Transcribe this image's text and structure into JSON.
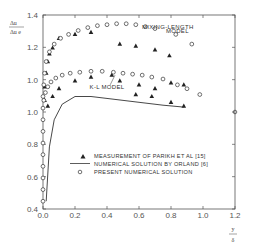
{
  "chart_data": {
    "type": "scatter",
    "title": "",
    "xlabel": "y / δ",
    "ylabel": "Δu / Δu_e",
    "xlim": [
      0.0,
      1.2
    ],
    "ylim": [
      0.4,
      1.4
    ],
    "x_ticks": [
      0.0,
      0.2,
      0.4,
      0.6,
      0.8,
      1.0,
      1.2
    ],
    "x_tick_labels": [
      "0.0",
      "0.2",
      "0.4",
      "0.6",
      "0.8",
      "1.0",
      "1.2"
    ],
    "y_tick_labels": [
      "1.4",
      "1.2",
      "1.0",
      "1.0",
      "0.8",
      "0.6",
      "0.4"
    ],
    "grid": false,
    "legend_position": "lower-center inside plot",
    "annotations": [
      {
        "text": "MIXING-LENGTH",
        "x": 0.78,
        "y": 1.33
      },
      {
        "text": "MODEL",
        "x": 0.84,
        "y": 1.305
      },
      {
        "text": "K-L MODEL",
        "x": 0.4,
        "y": 1.02
      }
    ],
    "series": [
      {
        "name": "MEASUREMENT OF PARIKH ET AL [15]",
        "marker": "triangle",
        "points": [
          [
            0.01,
            0.96
          ],
          [
            0.01,
            1.03
          ],
          [
            0.02,
            1.1
          ],
          [
            0.03,
            1.16
          ],
          [
            0.04,
            1.2
          ],
          [
            0.06,
            1.23
          ],
          [
            0.1,
            1.28
          ],
          [
            0.2,
            1.3
          ],
          [
            0.3,
            1.31
          ],
          [
            0.48,
            1.25
          ],
          [
            0.58,
            1.24
          ],
          [
            0.7,
            1.22
          ],
          [
            0.79,
            1.19
          ],
          [
            0.03,
            0.93
          ],
          [
            0.06,
            0.98
          ],
          [
            0.1,
            1.02
          ],
          [
            0.2,
            1.06
          ],
          [
            0.3,
            1.08
          ],
          [
            0.43,
            1.09
          ],
          [
            0.48,
            1.06
          ],
          [
            0.6,
            1.04
          ],
          [
            0.7,
            1.02
          ],
          [
            0.8,
            1.05
          ],
          [
            0.88,
            1.04
          ],
          [
            0.58,
            0.99
          ],
          [
            0.68,
            0.98
          ],
          [
            0.8,
            0.95
          ],
          [
            0.88,
            0.93
          ]
        ]
      },
      {
        "name": "NUMERICAL SOLUTION BY ORLAND [6]",
        "marker": "line",
        "points": [
          [
            0.02,
            0.44
          ],
          [
            0.04,
            0.72
          ],
          [
            0.07,
            0.86
          ],
          [
            0.12,
            0.94
          ],
          [
            0.2,
            0.98
          ],
          [
            0.3,
            0.98
          ],
          [
            0.45,
            0.965
          ],
          [
            0.6,
            0.95
          ],
          [
            0.75,
            0.935
          ],
          [
            0.88,
            0.925
          ]
        ]
      },
      {
        "name": "PRESENT NUMERICAL SOLUTION (mixing-length model)",
        "marker": "circle",
        "points": [
          [
            0.0,
            0.44
          ],
          [
            0.0,
            0.5
          ],
          [
            0.0,
            0.56
          ],
          [
            0.0,
            0.62
          ],
          [
            0.0,
            0.68
          ],
          [
            0.0,
            0.74
          ],
          [
            0.0,
            0.8
          ],
          [
            0.0,
            0.86
          ],
          [
            0.0,
            0.92
          ],
          [
            0.0,
            0.98
          ],
          [
            0.005,
            1.04
          ],
          [
            0.01,
            1.1
          ],
          [
            0.02,
            1.16
          ],
          [
            0.04,
            1.21
          ],
          [
            0.07,
            1.25
          ],
          [
            0.11,
            1.28
          ],
          [
            0.16,
            1.3
          ],
          [
            0.22,
            1.32
          ],
          [
            0.28,
            1.335
          ],
          [
            0.34,
            1.345
          ],
          [
            0.4,
            1.35
          ],
          [
            0.46,
            1.355
          ],
          [
            0.52,
            1.355
          ],
          [
            0.58,
            1.35
          ],
          [
            0.64,
            1.34
          ],
          [
            0.7,
            1.33
          ],
          [
            0.83,
            1.3
          ],
          [
            0.93,
            1.25
          ]
        ]
      },
      {
        "name": "PRESENT NUMERICAL SOLUTION (K-L model)",
        "marker": "circle",
        "points": [
          [
            0.005,
            0.96
          ],
          [
            0.015,
            1.0
          ],
          [
            0.03,
            1.03
          ],
          [
            0.05,
            1.055
          ],
          [
            0.08,
            1.075
          ],
          [
            0.12,
            1.09
          ],
          [
            0.17,
            1.1
          ],
          [
            0.23,
            1.105
          ],
          [
            0.3,
            1.11
          ],
          [
            0.37,
            1.11
          ],
          [
            0.44,
            1.105
          ],
          [
            0.5,
            1.1
          ],
          [
            0.56,
            1.095
          ],
          [
            0.62,
            1.09
          ],
          [
            0.68,
            1.08
          ],
          [
            0.75,
            1.07
          ],
          [
            0.84,
            1.04
          ],
          [
            0.9,
            1.02
          ],
          [
            0.98,
            0.99
          ]
        ]
      }
    ]
  },
  "legend": {
    "items": [
      {
        "symbol": "▲",
        "label": "MEASUREMENT OF PARIKH ET AL [15]"
      },
      {
        "symbol": "—",
        "label": "NUMERICAL SOLUTION BY ORLAND [6]"
      },
      {
        "symbol": "○",
        "label": "PRESENT NUMERICAL SOLUTION"
      }
    ]
  },
  "axis": {
    "ylabel_top": "Δu",
    "ylabel_bottom": "Δu e",
    "xlabel_top": "y",
    "xlabel_bottom": "δ"
  },
  "colors": {
    "ink": "#333333",
    "frame": "#555555",
    "background": "#ffffff"
  }
}
